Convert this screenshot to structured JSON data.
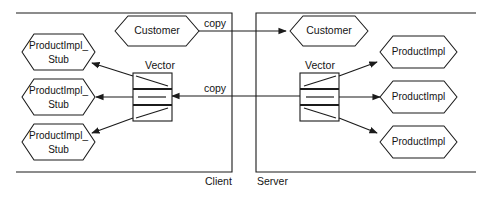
{
  "diagram": {
    "stroke_color": "#1b1b1b",
    "background_color": "#ffffff",
    "zones": [
      {
        "id": "client",
        "label": "Client"
      },
      {
        "id": "server",
        "label": "Server"
      }
    ],
    "client": {
      "customer": {
        "label": "Customer"
      },
      "vector": {
        "label": "Vector",
        "cells": [
          "",
          "",
          ""
        ]
      },
      "stubs": [
        {
          "line1": "ProductImpl_",
          "line2": "Stub"
        },
        {
          "line1": "ProductImpl_",
          "line2": "Stub"
        },
        {
          "line1": "ProductImpl_",
          "line2": "Stub"
        }
      ]
    },
    "server": {
      "customer": {
        "label": "Customer"
      },
      "vector": {
        "label": "Vector",
        "cells": [
          "",
          "",
          ""
        ]
      },
      "impls": [
        {
          "label": "ProductImpl"
        },
        {
          "label": "ProductImpl"
        },
        {
          "label": "ProductImpl"
        }
      ]
    },
    "edges": [
      {
        "id": "copy-customer",
        "label": "copy",
        "from": "server.customer",
        "to": "client.customer"
      },
      {
        "id": "copy-vector",
        "label": "copy",
        "from": "server.vector",
        "to": "client.vector"
      }
    ]
  }
}
